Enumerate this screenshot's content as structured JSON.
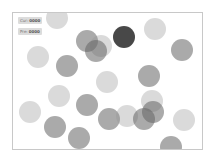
{
  "hud": {
    "current_label": "Cur:",
    "current_value": "0000",
    "previous_label": "Pre:",
    "previous_value": "0000"
  },
  "colors": {
    "light": "rgba(150,150,150,0.35)",
    "medium": "rgba(100,100,100,0.55)",
    "dark": "rgba(40,40,40,0.85)",
    "frame_border": "#c8c8c8"
  },
  "circles": [
    {
      "x": 56,
      "y": 17,
      "r": 11,
      "tone": "light"
    },
    {
      "x": 86,
      "y": 40,
      "r": 11,
      "tone": "medium"
    },
    {
      "x": 100,
      "y": 45,
      "r": 11,
      "tone": "light"
    },
    {
      "x": 95,
      "y": 50,
      "r": 11,
      "tone": "medium"
    },
    {
      "x": 123,
      "y": 36,
      "r": 11,
      "tone": "dark"
    },
    {
      "x": 154,
      "y": 28,
      "r": 11,
      "tone": "light"
    },
    {
      "x": 181,
      "y": 49,
      "r": 11,
      "tone": "medium"
    },
    {
      "x": 37,
      "y": 56,
      "r": 11,
      "tone": "light"
    },
    {
      "x": 66,
      "y": 65,
      "r": 11,
      "tone": "medium"
    },
    {
      "x": 106,
      "y": 81,
      "r": 11,
      "tone": "light"
    },
    {
      "x": 148,
      "y": 75,
      "r": 11,
      "tone": "medium"
    },
    {
      "x": 58,
      "y": 95,
      "r": 11,
      "tone": "light"
    },
    {
      "x": 29,
      "y": 111,
      "r": 11,
      "tone": "light"
    },
    {
      "x": 86,
      "y": 104,
      "r": 11,
      "tone": "medium"
    },
    {
      "x": 54,
      "y": 126,
      "r": 11,
      "tone": "medium"
    },
    {
      "x": 78,
      "y": 137,
      "r": 11,
      "tone": "medium"
    },
    {
      "x": 108,
      "y": 118,
      "r": 11,
      "tone": "medium"
    },
    {
      "x": 126,
      "y": 115,
      "r": 11,
      "tone": "light"
    },
    {
      "x": 151,
      "y": 100,
      "r": 11,
      "tone": "light"
    },
    {
      "x": 152,
      "y": 111,
      "r": 11,
      "tone": "medium"
    },
    {
      "x": 143,
      "y": 118,
      "r": 11,
      "tone": "medium"
    },
    {
      "x": 183,
      "y": 119,
      "r": 11,
      "tone": "light"
    },
    {
      "x": 170,
      "y": 146,
      "r": 11,
      "tone": "medium"
    }
  ]
}
